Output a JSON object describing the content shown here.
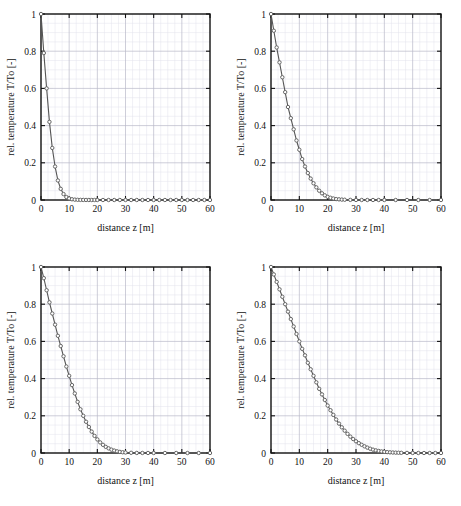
{
  "figure": {
    "panel_count": 4,
    "background": "#ffffff",
    "line_color": "#555555",
    "marker_color": "#666666",
    "axis_color": "#111111",
    "major_grid_color": "#b9b9c9",
    "minor_grid_color": "#e2e2ec"
  },
  "axes": {
    "xlabel": "distance z [m]",
    "ylabel": "rel. temperature T/To [-]",
    "xticks": [
      "0",
      "10",
      "20",
      "30",
      "40",
      "50",
      "60"
    ],
    "yticks": [
      "0",
      "0.2",
      "0.4",
      "0.6",
      "0.8",
      "1"
    ],
    "xlim": [
      0,
      60
    ],
    "ylim": [
      0,
      1
    ],
    "grid": "on",
    "minor_grid": "on",
    "legend": "none"
  },
  "chart_data": [
    {
      "type": "line",
      "title": "",
      "panel": "top-left",
      "xlabel": "distance z [m]",
      "ylabel": "rel. temperature T/To [-]",
      "xlim": [
        0,
        60
      ],
      "ylim": [
        0,
        1
      ],
      "xticks": [
        0,
        10,
        20,
        30,
        40,
        50,
        60
      ],
      "yticks": [
        0,
        0.2,
        0.4,
        0.6,
        0.8,
        1
      ],
      "grid": true,
      "legend_position": "none",
      "marker": "circle",
      "x": [
        0,
        1,
        2,
        3,
        4,
        5,
        6,
        7,
        8,
        9,
        10,
        11,
        12,
        13,
        14,
        15,
        16,
        17,
        18,
        19,
        20,
        22,
        24,
        26,
        28,
        30,
        32,
        34,
        36,
        38,
        40,
        42,
        44,
        46,
        48,
        50,
        52,
        54,
        56,
        58,
        60
      ],
      "y": [
        1.0,
        0.79,
        0.6,
        0.42,
        0.28,
        0.18,
        0.105,
        0.06,
        0.032,
        0.016,
        0.008,
        0.004,
        0.002,
        0.001,
        0.0006,
        0.0003,
        0.0002,
        0.0001,
        0.0,
        0.0,
        0.0,
        0.0,
        0.0,
        0.0,
        0.0,
        0.0,
        0.0,
        0.0,
        0.0,
        0.0,
        0.0,
        0.0,
        0.0,
        0.0,
        0.0,
        0.0,
        0.0,
        0.0,
        0.0,
        0.0,
        0.0
      ]
    },
    {
      "type": "line",
      "title": "",
      "panel": "top-right",
      "xlabel": "distance z [m]",
      "ylabel": "rel. temperature T/To [-]",
      "xlim": [
        0,
        60
      ],
      "ylim": [
        0,
        1
      ],
      "xticks": [
        0,
        10,
        20,
        30,
        40,
        50,
        60
      ],
      "yticks": [
        0,
        0.2,
        0.4,
        0.6,
        0.8,
        1
      ],
      "grid": true,
      "legend_position": "none",
      "marker": "circle",
      "x": [
        0,
        1,
        2,
        3,
        4,
        5,
        6,
        7,
        8,
        9,
        10,
        11,
        12,
        13,
        14,
        15,
        16,
        17,
        18,
        19,
        20,
        21,
        22,
        23,
        24,
        25,
        26,
        28,
        30,
        32,
        34,
        36,
        38,
        40,
        44,
        48,
        52,
        56,
        60
      ],
      "y": [
        1.0,
        0.91,
        0.82,
        0.74,
        0.66,
        0.58,
        0.5,
        0.44,
        0.38,
        0.32,
        0.27,
        0.22,
        0.18,
        0.145,
        0.115,
        0.09,
        0.068,
        0.05,
        0.036,
        0.025,
        0.017,
        0.012,
        0.008,
        0.005,
        0.0035,
        0.0022,
        0.0014,
        0.0006,
        0.0002,
        0.0001,
        0.0,
        0.0,
        0.0,
        0.0,
        0.0,
        0.0,
        0.0,
        0.0,
        0.0
      ]
    },
    {
      "type": "line",
      "title": "",
      "panel": "bottom-left",
      "xlabel": "distance z [m]",
      "ylabel": "rel. temperature T/To [-]",
      "xlim": [
        0,
        60
      ],
      "ylim": [
        0,
        1
      ],
      "xticks": [
        0,
        10,
        20,
        30,
        40,
        50,
        60
      ],
      "yticks": [
        0,
        0.2,
        0.4,
        0.6,
        0.8,
        1
      ],
      "grid": true,
      "legend_position": "none",
      "marker": "circle",
      "x": [
        0,
        1,
        2,
        3,
        4,
        5,
        6,
        7,
        8,
        9,
        10,
        11,
        12,
        13,
        14,
        15,
        16,
        17,
        18,
        19,
        20,
        21,
        22,
        23,
        24,
        25,
        26,
        27,
        28,
        29,
        30,
        32,
        34,
        36,
        38,
        40,
        44,
        48,
        52,
        56,
        60
      ],
      "y": [
        1.0,
        0.94,
        0.875,
        0.81,
        0.75,
        0.69,
        0.63,
        0.575,
        0.52,
        0.465,
        0.415,
        0.365,
        0.32,
        0.275,
        0.235,
        0.2,
        0.168,
        0.14,
        0.115,
        0.092,
        0.073,
        0.057,
        0.044,
        0.033,
        0.025,
        0.018,
        0.013,
        0.009,
        0.006,
        0.004,
        0.0027,
        0.0011,
        0.0004,
        0.0002,
        0.0001,
        0.0,
        0.0,
        0.0,
        0.0,
        0.0,
        0.0
      ]
    },
    {
      "type": "line",
      "title": "",
      "panel": "bottom-right",
      "xlabel": "distance z [m]",
      "ylabel": "rel. temperature T/To [-]",
      "xlim": [
        0,
        60
      ],
      "ylim": [
        0,
        1
      ],
      "xticks": [
        0,
        10,
        20,
        30,
        40,
        50,
        60
      ],
      "yticks": [
        0,
        0.2,
        0.4,
        0.6,
        0.8,
        1
      ],
      "grid": true,
      "legend_position": "none",
      "marker": "circle",
      "x": [
        0,
        1,
        2,
        3,
        4,
        5,
        6,
        7,
        8,
        9,
        10,
        11,
        12,
        13,
        14,
        15,
        16,
        17,
        18,
        19,
        20,
        21,
        22,
        23,
        24,
        25,
        26,
        27,
        28,
        29,
        30,
        31,
        32,
        33,
        34,
        35,
        36,
        37,
        38,
        39,
        40,
        41,
        42,
        43,
        44,
        45,
        46,
        48,
        50,
        52,
        54,
        56,
        58,
        60
      ],
      "y": [
        1.0,
        0.96,
        0.92,
        0.88,
        0.84,
        0.8,
        0.76,
        0.72,
        0.68,
        0.64,
        0.6,
        0.56,
        0.525,
        0.485,
        0.45,
        0.415,
        0.38,
        0.345,
        0.315,
        0.285,
        0.255,
        0.23,
        0.205,
        0.18,
        0.158,
        0.138,
        0.12,
        0.103,
        0.088,
        0.075,
        0.063,
        0.053,
        0.044,
        0.036,
        0.029,
        0.023,
        0.018,
        0.014,
        0.011,
        0.0085,
        0.0064,
        0.0048,
        0.0035,
        0.0026,
        0.0019,
        0.0013,
        0.0009,
        0.0005,
        0.0002,
        0.0001,
        0.0,
        0.0,
        0.0,
        0.0
      ]
    }
  ]
}
